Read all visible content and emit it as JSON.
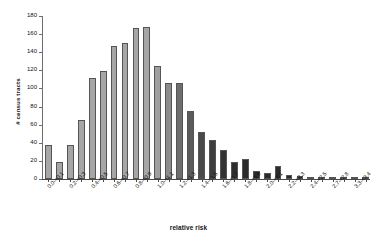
{
  "chart_data": {
    "type": "bar",
    "title": "",
    "xlabel": "relative risk",
    "ylabel": "# census tracts",
    "ylim": [
      0,
      180
    ],
    "ytick_values": [
      0,
      20,
      40,
      60,
      80,
      100,
      120,
      140,
      160,
      180
    ],
    "ytick_labels": [
      "0",
      "20",
      "40",
      "60",
      "80",
      "100",
      "120",
      "140",
      "160",
      "180"
    ],
    "grid": false,
    "legend": null,
    "categories": [
      "0.0-<0.1",
      "0.1-<0.2",
      "0.2-<0.3",
      "0.3-<0.4",
      "0.4-<0.5",
      "0.5-<0.6",
      "0.6-<0.7",
      "0.7-<0.8",
      "0.8-<0.9",
      "0.9-<1.0",
      "1.0-<1.1",
      "1.1-<1.2",
      "1.2-<1.3",
      "1.3-<1.4",
      "1.4-<1.5",
      "1.5-<1.6",
      "1.6-<1.7",
      "1.7-<1.8",
      "1.8-<1.9",
      "1.9-<2.0",
      "2.0-<2.1",
      "2.1-<2.2",
      "2.2-<2.3",
      "2.3-<2.4",
      "2.4-<2.5",
      "2.5-<2.6",
      "2.7-<2.8",
      "2.8-<2.9",
      "3.3-<3.4",
      "3.4-<3.5"
    ],
    "visible_tick_labels": [
      "0.0-<0.1",
      "0.2-<0.3",
      "0.4-<0.5",
      "0.6-<0.7",
      "0.8-<0.9",
      "1.0-<1.1",
      "1.2-<1.3",
      "1.4-<1.5",
      "1.6-<1.7",
      "1.8-<1.9",
      "2.0-<2.1",
      "2.2-<2.3",
      "2.4-<2.5",
      "2.7-<2.8",
      "3.3-<3.4"
    ],
    "values": [
      38,
      19,
      38,
      65,
      112,
      119,
      147,
      150,
      167,
      168,
      125,
      106,
      106,
      75,
      52,
      43,
      32,
      19,
      22,
      9,
      7,
      14,
      4,
      3,
      1,
      2,
      2,
      2,
      2,
      1
    ],
    "bar_colors": [
      "#a6a6a6",
      "#a6a6a6",
      "#a6a6a6",
      "#a6a6a6",
      "#a6a6a6",
      "#a6a6a6",
      "#a6a6a6",
      "#a6a6a6",
      "#a6a6a6",
      "#a6a6a6",
      "#a0a0a0",
      "#8c8c8c",
      "#6e6e6e",
      "#5a5a5a",
      "#4a4a4a",
      "#3d3d3d",
      "#333333",
      "#2e2e2e",
      "#2b2b2b",
      "#2b2b2b",
      "#2b2b2b",
      "#2b2b2b",
      "#2b2b2b",
      "#2b2b2b",
      "#2b2b2b",
      "#2b2b2b",
      "#2b2b2b",
      "#2b2b2b",
      "#2b2b2b",
      "#2b2b2b"
    ],
    "bar_edge_color": "#555555",
    "background_color": "#ffffff",
    "axis_color": "#4a4a4a"
  }
}
